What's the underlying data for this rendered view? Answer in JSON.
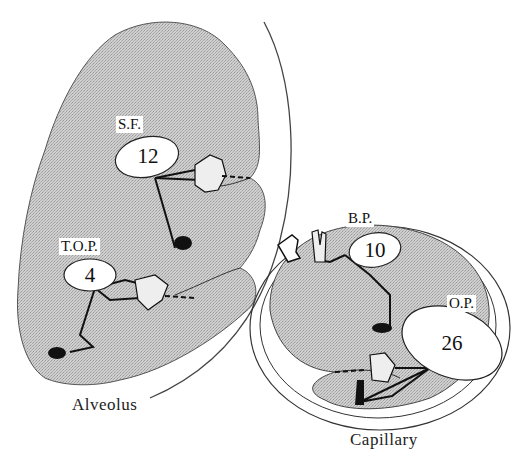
{
  "diagram": {
    "alveolus": {
      "caption": "Alveolus",
      "forces": [
        {
          "abbr": "S.F.",
          "value": "12"
        },
        {
          "abbr": "T.O.P.",
          "value": "4"
        }
      ]
    },
    "capillary": {
      "caption": "Capillary",
      "forces": [
        {
          "abbr": "B.P.",
          "value": "10"
        },
        {
          "abbr": "O.P.",
          "value": "26"
        }
      ]
    },
    "colors": {
      "fill": "#c4c4c4",
      "stroke": "#222222",
      "background": "#ffffff"
    }
  }
}
